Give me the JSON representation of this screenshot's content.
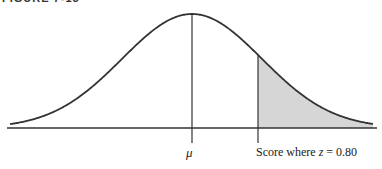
{
  "figure": {
    "caption": "FIGURE 7-15",
    "mean_label": "μ",
    "score_label_prefix": "Score where ",
    "score_label_var": "z",
    "score_label_suffix": " = 0.80",
    "z_value": 0.8,
    "colors": {
      "curve": "#333333",
      "shade": "#d6d6d6",
      "axis": "#333333"
    }
  },
  "chart_data": {
    "type": "area",
    "distribution": "normal",
    "mean_label": "μ",
    "marker_z": 0.8,
    "shaded_region": "z > 0.80 (upper tail)",
    "annotations": [
      "μ",
      "Score where z = 0.80"
    ],
    "xlabel": "",
    "ylabel": ""
  }
}
